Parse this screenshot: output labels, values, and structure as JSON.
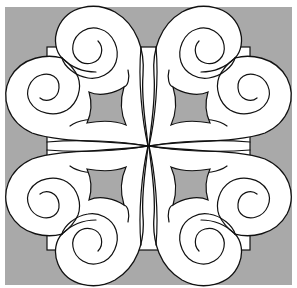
{
  "figure": {
    "title": "Quilt block pattern: four-way mirrored heart scroll motif",
    "colors": {
      "background": "#a9a9a9",
      "motif_fill": "#ffffff",
      "outline": "#111111",
      "page": "#ffffff"
    },
    "quadrants": [
      "top-left",
      "top-right",
      "bottom-left",
      "bottom-right"
    ],
    "elements_per_quadrant": [
      "upper-spiral-lobe",
      "side-spiral-lobe",
      "concave-diamond-opening",
      "center-petal-strip"
    ]
  }
}
